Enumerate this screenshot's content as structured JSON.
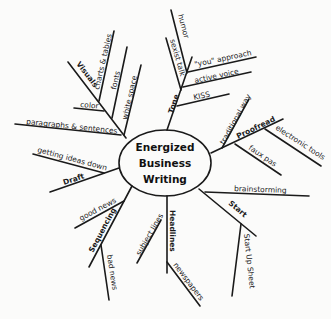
{
  "center": {
    "lines": [
      "Energized",
      "Business",
      "Writing"
    ]
  },
  "branches": {
    "visuals": {
      "label": "Visuals",
      "children": [
        "charts & tables",
        "fonts",
        "white space",
        "color",
        "paragraphs & sentences"
      ]
    },
    "tone": {
      "label": "Tone",
      "children": [
        "humor",
        "sexist talk",
        "\"you\" approach",
        "active voice",
        "KISS"
      ]
    },
    "proofread": {
      "label": "Proofread",
      "children": [
        "traditional way",
        "electronic tools",
        "faux pas"
      ]
    },
    "draft": {
      "label": "Draft",
      "children": [
        "getting ideas down"
      ]
    },
    "start": {
      "label": "Start",
      "children": [
        "brainstorming",
        "Start Up Sheet"
      ]
    },
    "headlines": {
      "label": "Headlines",
      "children": [
        "subject lines",
        "newspapers"
      ]
    },
    "sequencing": {
      "label": "Sequencing",
      "children": [
        "good news",
        "bad news"
      ]
    }
  }
}
